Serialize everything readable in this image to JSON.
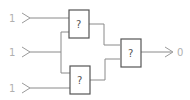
{
  "diagram": {
    "type": "logic-circuit",
    "inputs": [
      {
        "id": "in1",
        "value": "1"
      },
      {
        "id": "in2",
        "value": "1"
      },
      {
        "id": "in3",
        "value": "1"
      }
    ],
    "gates": [
      {
        "id": "gate1",
        "label": "?",
        "inputs": [
          "in1",
          "in2"
        ]
      },
      {
        "id": "gate2",
        "label": "?",
        "inputs": [
          "in2",
          "in3"
        ]
      },
      {
        "id": "gate3",
        "label": "?",
        "inputs": [
          "gate1",
          "gate2"
        ]
      }
    ],
    "output": {
      "id": "out",
      "value": "0",
      "source": "gate3"
    },
    "colors": {
      "wire": "#8a8a8a",
      "gate_border": "#555555",
      "io_text": "#b0b0b0"
    }
  }
}
